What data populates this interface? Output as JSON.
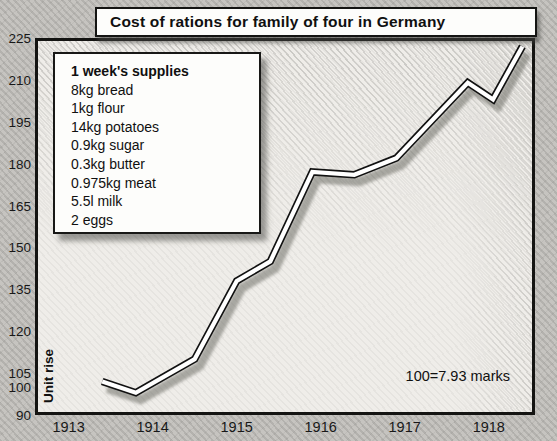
{
  "title": "Cost of rations for family of four in Germany",
  "legend": {
    "heading": "1 week's supplies",
    "items": [
      "8kg bread",
      "1kg flour",
      "14kg potatoes",
      "0.9kg sugar",
      "0.3kg butter",
      "0.975kg meat",
      "5.5l milk",
      "2 eggs"
    ]
  },
  "y_axis_label": "Unit rise",
  "annotation": "100=7.93 marks",
  "colors": {
    "background": "#c6c4c0",
    "plot_background": "#efede9",
    "line_fill": "#ffffff",
    "line_outline": "#111111",
    "text": "#101010"
  },
  "chart_data": {
    "type": "line",
    "title": "Cost of rations for family of four in Germany",
    "xlabel": "",
    "ylabel": "Unit rise",
    "x": [
      1913.4,
      1913.8,
      1914.5,
      1915.0,
      1915.4,
      1915.9,
      1916.4,
      1916.9,
      1917.75,
      1918.05,
      1918.4
    ],
    "values": [
      102,
      98,
      110,
      138,
      145,
      177,
      176,
      182,
      209,
      203,
      222
    ],
    "x_ticks": [
      1913,
      1914,
      1915,
      1916,
      1917,
      1918
    ],
    "y_ticks": [
      225,
      210,
      195,
      180,
      165,
      150,
      135,
      120,
      105,
      100,
      90
    ],
    "xlim": [
      1912.6,
      1918.55
    ],
    "ylim": [
      90,
      225
    ],
    "grid": false,
    "legend_position": "upper-left",
    "annotation": "100=7.93 marks",
    "note": "index of ration cost, 100 = 7.93 marks"
  }
}
